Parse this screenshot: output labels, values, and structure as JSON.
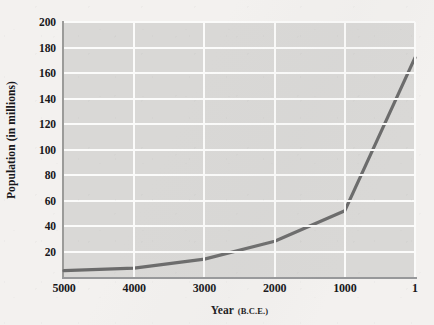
{
  "chart_data": {
    "type": "line",
    "title": "",
    "subtitle": "",
    "xlabel": "Year",
    "xlabel_unit": "(B.C.E.)",
    "ylabel": "Population (in millions)",
    "x_tick_labels": [
      "5000",
      "4000",
      "3000",
      "2000",
      "1000",
      "1"
    ],
    "y_tick_labels": [
      "20",
      "40",
      "60",
      "80",
      "100",
      "120",
      "140",
      "160",
      "180",
      "200"
    ],
    "y_tick_values": [
      20,
      40,
      60,
      80,
      100,
      120,
      140,
      160,
      180,
      200
    ],
    "ylim": [
      0,
      200
    ],
    "xlim_bce": [
      5000,
      1
    ],
    "x_axis_direction": "descending",
    "grid": "horizontal-and-vertical-white",
    "legend": "none",
    "plot_background_color": "#d9d8d6",
    "page_background_color": "#f3f1ef",
    "gridline_color": "#fbfbfa",
    "line_color": "#6b6b6b",
    "line_width_px": 3.2,
    "markers": "none",
    "annotations": [],
    "x": [
      5000,
      4000,
      3000,
      2000,
      1000,
      1
    ],
    "values": [
      5,
      7,
      14,
      28,
      52,
      172
    ],
    "series": [
      {
        "name": "World population",
        "x": [
          5000,
          4000,
          3000,
          2000,
          1000,
          1
        ],
        "values": [
          5,
          7,
          14,
          28,
          52,
          172
        ]
      }
    ]
  }
}
